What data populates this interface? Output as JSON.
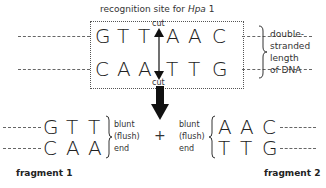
{
  "title": {
    "prefix": "recognition site for ",
    "enzyme": "Hpa",
    "suffix": " 1"
  },
  "site": {
    "top_strand": [
      "G",
      "T",
      "T",
      "A",
      "A",
      "C"
    ],
    "bottom_strand": [
      "C",
      "A",
      "A",
      "T",
      "T",
      "G"
    ],
    "cut_top": "cut",
    "cut_bottom": "cut"
  },
  "dna_label": [
    "double-",
    "stranded",
    "length",
    "of DNA"
  ],
  "plus": "+",
  "fragment1": {
    "top": [
      "G",
      "T",
      "T"
    ],
    "bottom": [
      "C",
      "A",
      "A"
    ],
    "end_label": [
      "blunt",
      "(flush)",
      "end"
    ],
    "name": "fragment 1"
  },
  "fragment2": {
    "top": [
      "A",
      "A",
      "C"
    ],
    "bottom": [
      "T",
      "T",
      "G"
    ],
    "end_label": [
      "blunt",
      "(flush)",
      "end"
    ],
    "name": "fragment 2"
  }
}
